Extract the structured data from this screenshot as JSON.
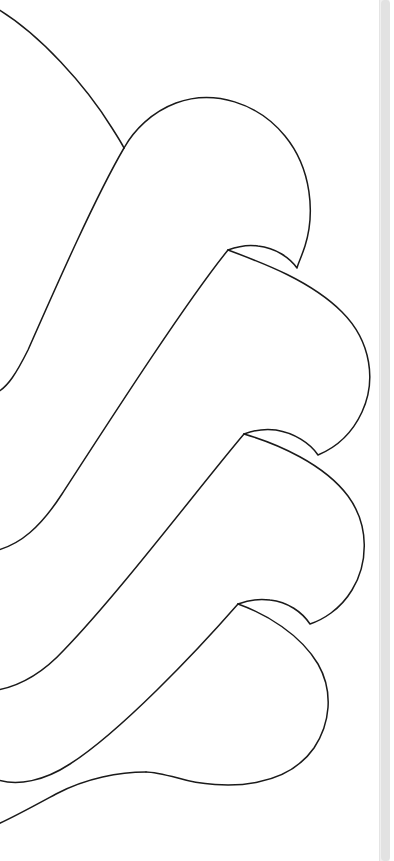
{
  "app": {
    "title": "Line Art Viewer",
    "background_color": "#ffffff",
    "stroke_color": "#1a1a1a",
    "stroke_width": 1.5,
    "viewport_width": 379,
    "viewport_height": 861
  },
  "artwork": {
    "name": "petal-line-drawing",
    "description": "Zoomed fan of five overlapping teardrop petal outlines drawn in thin black line, radiating from an origin off the left edge toward the right",
    "stroke_color": "#1a1a1a",
    "fill": "none",
    "view_box": "0 0 379 861",
    "paths": [
      {
        "name": "petal-1-outer-arc",
        "label": "Petal 1 upper arc",
        "d": "M -4 8 C 40 34, 86 86, 112 128 C 117 136, 121 142, 124 148"
      },
      {
        "name": "petal-2-outline",
        "label": "Petal 2 outline",
        "d": "M 124 148 C 134 130, 152 112, 176 103 C 214 89, 258 103, 285 136 C 312 169, 315 214, 305 246 C 301 258, 298 264, 297 268 C 290 258, 276 248, 258 246 C 246 244, 236 247, 228 250"
      },
      {
        "name": "petal-2-lower-sweep",
        "label": "Petal 2 lower sweep to left edge",
        "d": "M 124 148 C 96 196, 58 282, 28 350 C 16 374, 8 386, -2 392"
      },
      {
        "name": "petal-3-outline",
        "label": "Petal 3 outline",
        "d": "M 228 250 C 260 262, 310 280, 342 312 C 372 342, 376 382, 362 412 C 350 438, 330 450, 318 455 C 310 443, 294 433, 276 430 C 262 428, 252 431, 244 434"
      },
      {
        "name": "petal-3-lower-sweep",
        "label": "Petal 3 lower sweep to left edge",
        "d": "M 228 250 C 186 302, 110 420, 62 494 C 40 528, 20 544, -2 550"
      },
      {
        "name": "petal-4-outline",
        "label": "Petal 4 outline",
        "d": "M 244 434 C 278 444, 324 464, 348 496 C 370 526, 368 564, 352 590 C 340 610, 322 620, 310 624 C 302 612, 288 602, 270 600 C 256 598, 246 601, 238 604"
      },
      {
        "name": "petal-4-lower-sweep",
        "label": "Petal 4 lower sweep to left edge",
        "d": "M 244 434 C 200 486, 120 592, 64 650 C 40 676, 18 686, -2 690"
      },
      {
        "name": "petal-5-outline",
        "label": "Petal 5 outline",
        "d": "M 238 604 C 266 614, 300 634, 318 664 C 334 692, 330 724, 314 748 C 300 768, 278 778, 258 782 C 230 788, 198 784, 178 778 C 162 774, 152 772, 146 772"
      },
      {
        "name": "petal-5-lower-sweep",
        "label": "Petal 5 lower sweep to left edge",
        "d": "M 238 604 C 196 652, 120 732, 70 764 C 44 781, 18 786, -2 780"
      },
      {
        "name": "petal-6-lower-edge",
        "label": "Petal 6 lower edge curve",
        "d": "M 146 772 C 120 772, 86 778, 56 794 C 32 807, 12 818, -2 824"
      }
    ]
  },
  "scrollbar": {
    "name": "vertical-scrollbar",
    "orientation": "vertical",
    "track_color": "#f0f0f0",
    "thumb_color": "#e2e2e2",
    "thumb_top_percent": 0,
    "thumb_height_percent": 100
  }
}
